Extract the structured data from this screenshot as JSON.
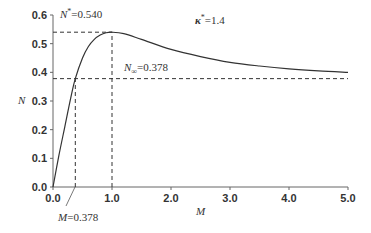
{
  "chart_data": {
    "type": "line",
    "title": "",
    "xlabel": "M",
    "ylabel": "N",
    "xlim": [
      0,
      5.0
    ],
    "ylim": [
      0,
      0.6
    ],
    "grid": false,
    "x_ticks": [
      "0.0",
      "1.0",
      "2.0",
      "3.0",
      "4.0",
      "5.0"
    ],
    "y_ticks": [
      "0.0",
      "0.1",
      "0.2",
      "0.3",
      "0.4",
      "0.5",
      "0.6"
    ],
    "series": [
      {
        "name": "N(M)",
        "x": [
          0,
          0.1,
          0.2,
          0.3,
          0.378,
          0.5,
          0.6,
          0.7,
          0.8,
          0.9,
          1.0,
          1.2,
          1.5,
          2.0,
          2.5,
          3.0,
          3.5,
          4.0,
          4.5,
          5.0
        ],
        "values": [
          0,
          0.11,
          0.21,
          0.31,
          0.378,
          0.45,
          0.49,
          0.515,
          0.53,
          0.538,
          0.54,
          0.535,
          0.515,
          0.48,
          0.455,
          0.435,
          0.422,
          0.412,
          0.405,
          0.4
        ]
      }
    ],
    "reference_lines": [
      {
        "type": "horizontal",
        "y": 0.54,
        "x_range": [
          0,
          1.0
        ]
      },
      {
        "type": "vertical",
        "x": 1.0,
        "y_range": [
          0,
          0.54
        ]
      },
      {
        "type": "horizontal",
        "y": 0.378,
        "x_range": [
          0,
          5.0
        ]
      },
      {
        "type": "vertical",
        "x": 0.378,
        "y_range": [
          0,
          0.378
        ]
      }
    ],
    "annotations": [
      {
        "text_main": "N",
        "text_sup": "*",
        "text_rest": "=0.540"
      },
      {
        "text_main": "N",
        "text_sub": "∞",
        "text_rest": "=0.378"
      },
      {
        "text_main": "κ",
        "text_sup": "*",
        "text_rest": "=1.4"
      },
      {
        "text_main": "M",
        "text_rest": "=0.378"
      }
    ]
  }
}
